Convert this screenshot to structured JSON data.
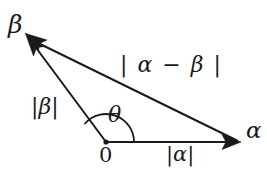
{
  "figure": {
    "type": "vector-triangle-diagram",
    "background_color": "#ffffff",
    "stroke_color": "#1a1a1a",
    "width": 267,
    "height": 171
  },
  "labels": {
    "vector_beta_head": "β",
    "vector_alpha_head": "α",
    "difference_magnitude": "| α − β |",
    "magnitude_beta": "|β|",
    "angle_theta": "θ",
    "origin": "0",
    "magnitude_alpha": "|α|"
  },
  "geometry": {
    "origin_point": {
      "x": 106,
      "y": 142
    },
    "alpha_tip": {
      "x": 240,
      "y": 142
    },
    "beta_tip": {
      "x": 26,
      "y": 34
    },
    "angle_arc_radius": 28
  }
}
